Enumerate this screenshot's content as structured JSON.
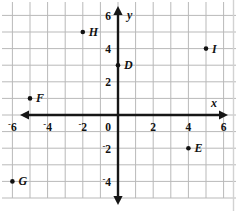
{
  "chart_data": {
    "type": "scatter",
    "title": "",
    "xlabel": "x",
    "ylabel": "y",
    "xlim": [
      -7,
      7
    ],
    "ylim": [
      -5,
      7
    ],
    "grid": true,
    "grid_step": 1,
    "legend": "none",
    "x_ticks": [
      -6,
      -4,
      -2,
      0,
      2,
      4,
      6
    ],
    "y_ticks": [
      6,
      4,
      2,
      0,
      -2,
      -4
    ],
    "x_tick_labels": [
      "-6",
      "-4",
      "-2",
      "0",
      "2",
      "4",
      "6"
    ],
    "y_tick_labels": [
      "6",
      "4",
      "2",
      "0",
      "-2",
      "-4"
    ],
    "points": [
      {
        "label": "H",
        "x": -2,
        "y": 5,
        "label_dx": 6,
        "label_dy": 4
      },
      {
        "label": "I",
        "x": 5,
        "y": 4,
        "label_dx": 6,
        "label_dy": 4
      },
      {
        "label": "D",
        "x": 0,
        "y": 3,
        "label_dx": 6,
        "label_dy": 4
      },
      {
        "label": "F",
        "x": -5,
        "y": 1,
        "label_dx": 6,
        "label_dy": 4
      },
      {
        "label": "E",
        "x": 4,
        "y": -2,
        "label_dx": 6,
        "label_dy": 4
      },
      {
        "label": "G",
        "x": -6,
        "y": -4,
        "label_dx": 6,
        "label_dy": 4
      }
    ]
  },
  "axes": {
    "x_axis_name": "x",
    "y_axis_name": "y",
    "origin_label": "0"
  },
  "colors": {
    "grid": "#b9b9b9",
    "axis": "#161616",
    "point": "#111111",
    "background": "#ffffff",
    "border": "#d2d2d2"
  }
}
